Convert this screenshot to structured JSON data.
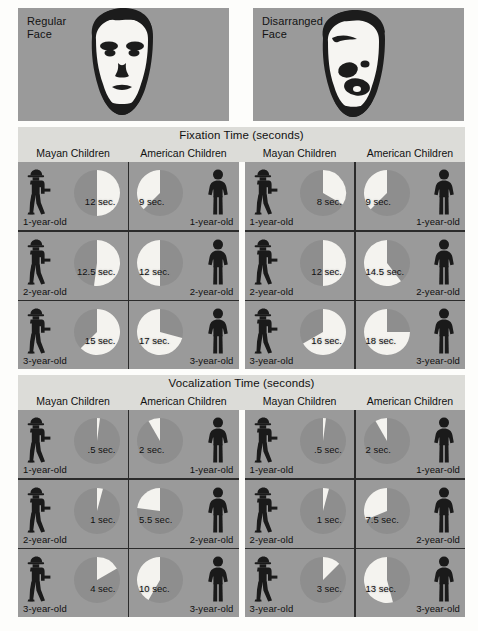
{
  "stimuli": [
    {
      "label": "Regular\nFace",
      "icon": "regular-face-image"
    },
    {
      "label": "Disarranged\nFace",
      "icon": "disarranged-face-image"
    }
  ],
  "sections": [
    {
      "title": "Fixation Time (seconds)",
      "column_headers": [
        "Mayan Children",
        "American Children",
        "Mayan Children",
        "American Children"
      ],
      "rows": [
        {
          "age": "1-year-old",
          "cells": [
            {
              "group": "Mayan Children",
              "stimulus": "Regular Face",
              "value": 12,
              "label": "12 sec."
            },
            {
              "group": "American Children",
              "stimulus": "Regular Face",
              "value": 9,
              "label": "9 sec."
            },
            {
              "group": "Mayan Children",
              "stimulus": "Disarranged Face",
              "value": 8,
              "label": "8 sec."
            },
            {
              "group": "American Children",
              "stimulus": "Disarranged Face",
              "value": 9,
              "label": "9 sec."
            }
          ]
        },
        {
          "age": "2-year-old",
          "cells": [
            {
              "group": "Mayan Children",
              "stimulus": "Regular Face",
              "value": 12.5,
              "label": "12.5 sec."
            },
            {
              "group": "American Children",
              "stimulus": "Regular Face",
              "value": 12,
              "label": "12 sec."
            },
            {
              "group": "Mayan Children",
              "stimulus": "Disarranged Face",
              "value": 12,
              "label": "12 sec."
            },
            {
              "group": "American Children",
              "stimulus": "Disarranged Face",
              "value": 14.5,
              "label": "14.5 sec."
            }
          ]
        },
        {
          "age": "3-year-old",
          "cells": [
            {
              "group": "Mayan Children",
              "stimulus": "Regular Face",
              "value": 15,
              "label": "15 sec."
            },
            {
              "group": "American Children",
              "stimulus": "Regular Face",
              "value": 17,
              "label": "17 sec."
            },
            {
              "group": "Mayan Children",
              "stimulus": "Disarranged Face",
              "value": 16,
              "label": "16 sec."
            },
            {
              "group": "American Children",
              "stimulus": "Disarranged Face",
              "value": 18,
              "label": "18 sec."
            }
          ]
        }
      ]
    },
    {
      "title": "Vocalization Time (seconds)",
      "column_headers": [
        "Mayan Children",
        "American Children",
        "Mayan Children",
        "American Children"
      ],
      "rows": [
        {
          "age": "1-year-old",
          "cells": [
            {
              "group": "Mayan Children",
              "stimulus": "Regular Face",
              "value": 0.5,
              "label": ".5 sec."
            },
            {
              "group": "American Children",
              "stimulus": "Regular Face",
              "value": 2,
              "label": "2 sec."
            },
            {
              "group": "Mayan Children",
              "stimulus": "Disarranged Face",
              "value": 0.5,
              "label": ".5 sec."
            },
            {
              "group": "American Children",
              "stimulus": "Disarranged Face",
              "value": 2,
              "label": "2 sec."
            }
          ]
        },
        {
          "age": "2-year-old",
          "cells": [
            {
              "group": "Mayan Children",
              "stimulus": "Regular Face",
              "value": 1,
              "label": "1 sec."
            },
            {
              "group": "American Children",
              "stimulus": "Regular Face",
              "value": 5.5,
              "label": "5.5 sec."
            },
            {
              "group": "Mayan Children",
              "stimulus": "Disarranged Face",
              "value": 1,
              "label": "1 sec."
            },
            {
              "group": "American Children",
              "stimulus": "Disarranged Face",
              "value": 7.5,
              "label": "7.5 sec."
            }
          ]
        },
        {
          "age": "3-year-old",
          "cells": [
            {
              "group": "Mayan Children",
              "stimulus": "Regular Face",
              "value": 4,
              "label": "4 sec."
            },
            {
              "group": "American Children",
              "stimulus": "Regular Face",
              "value": 10,
              "label": "10 sec."
            },
            {
              "group": "Mayan Children",
              "stimulus": "Disarranged Face",
              "value": 3,
              "label": "3 sec."
            },
            {
              "group": "American Children",
              "stimulus": "Disarranged Face",
              "value": 13,
              "label": "13 sec."
            }
          ]
        }
      ]
    }
  ],
  "colors": {
    "panel_background": "#9a9a9a",
    "band_background": "#dcdcd8",
    "pie_wedge": "#f4f3ef",
    "pie_remainder": "#8e8e8e",
    "figure": "#1a1a1a",
    "divider": "#2b2b2b",
    "page": "#fdfdfb"
  },
  "chart_data": [
    {
      "type": "pie",
      "title": "Fixation Time (seconds)",
      "unit": "seconds",
      "scale_max": 24,
      "categories": [
        "1-year-old",
        "2-year-old",
        "3-year-old"
      ],
      "series": [
        {
          "name": "Mayan Children – Regular Face",
          "values": [
            12,
            12.5,
            15
          ]
        },
        {
          "name": "American Children – Regular Face",
          "values": [
            9,
            12,
            17
          ]
        },
        {
          "name": "Mayan Children – Disarranged Face",
          "values": [
            8,
            12,
            16
          ]
        },
        {
          "name": "American Children – Disarranged Face",
          "values": [
            9,
            14.5,
            18
          ]
        }
      ]
    },
    {
      "type": "pie",
      "title": "Vocalization Time (seconds)",
      "unit": "seconds",
      "scale_max": 24,
      "categories": [
        "1-year-old",
        "2-year-old",
        "3-year-old"
      ],
      "series": [
        {
          "name": "Mayan Children – Regular Face",
          "values": [
            0.5,
            1,
            4
          ]
        },
        {
          "name": "American Children – Regular Face",
          "values": [
            2,
            5.5,
            10
          ]
        },
        {
          "name": "Mayan Children – Disarranged Face",
          "values": [
            0.5,
            1,
            3
          ]
        },
        {
          "name": "American Children – Disarranged Face",
          "values": [
            2,
            7.5,
            13
          ]
        }
      ]
    }
  ]
}
